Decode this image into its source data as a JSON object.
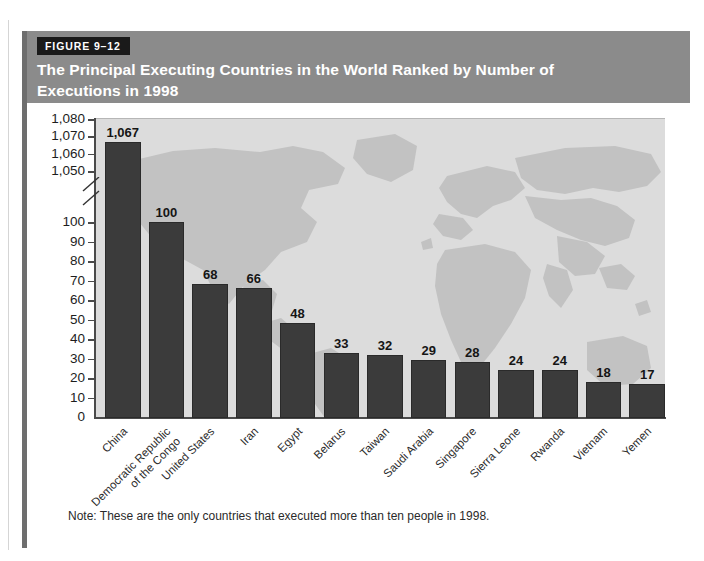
{
  "figure": {
    "tag": "FIGURE 9–12",
    "note": "Note: These are the only countries that executed more than ten people in 1998."
  },
  "colors": {
    "header_band": "#8b8b8b",
    "tag_background": "#1a1a1a",
    "tag_text": "#ffffff",
    "title_text": "#ffffff",
    "bar_fill": "#3b3b3b",
    "plot_background": "#dcdcdc",
    "map_land": "#c2c2c2",
    "axis": "#4a4a4a",
    "accent_bar": "#6e6e6e"
  },
  "chart_data": {
    "type": "bar",
    "xlabel": "",
    "ylabel": "",
    "grid": false,
    "legend": "none",
    "axis_break": {
      "present": true,
      "between": [
        100,
        1050
      ],
      "marker": "double-slash"
    },
    "y_ticks_lower": [
      0,
      10,
      20,
      30,
      40,
      50,
      60,
      70,
      80,
      90,
      100
    ],
    "y_ticks_upper": [
      1050,
      1060,
      1070,
      1080
    ],
    "y_tick_labels": [
      "0",
      "10",
      "20",
      "30",
      "40",
      "50",
      "60",
      "70",
      "80",
      "90",
      "100",
      "1,050",
      "1,060",
      "1,070",
      "1,080"
    ],
    "ylim_lower": [
      0,
      100
    ],
    "ylim_upper": [
      1045,
      1080
    ],
    "categories": [
      "China",
      "Democratic Republic\nof the Congo",
      "United States",
      "Iran",
      "Egypt",
      "Belarus",
      "Taiwan",
      "Saudi Arabia",
      "Singapore",
      "Sierra Leone",
      "Rwanda",
      "Vietnam",
      "Yemen"
    ],
    "values": [
      1067,
      100,
      68,
      66,
      48,
      33,
      32,
      29,
      28,
      24,
      24,
      18,
      17
    ],
    "value_labels": [
      "1,067",
      "100",
      "68",
      "66",
      "48",
      "33",
      "32",
      "29",
      "28",
      "24",
      "24",
      "18",
      "17"
    ],
    "note": "Note: These are the only countries that executed more than ten people in 1998."
  }
}
